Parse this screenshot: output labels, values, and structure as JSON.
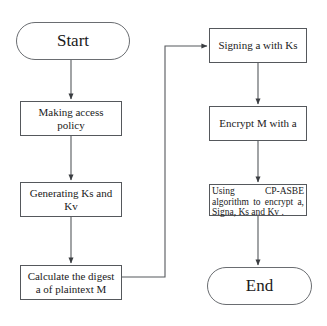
{
  "diagram": {
    "background_color": "#ffffff",
    "line_color": "#55585c",
    "text_color": "#1a1a1a",
    "nodes": {
      "start": {
        "label": "Start",
        "shape": "terminator"
      },
      "making_access_policy": {
        "label": "Making access policy",
        "shape": "process"
      },
      "generating_keys": {
        "label": "Generating Ks and Kv",
        "shape": "process"
      },
      "calculate_digest": {
        "label": "Calculate the digest a of plaintext M",
        "shape": "process"
      },
      "signing": {
        "label": "Signing a with Ks",
        "shape": "process"
      },
      "encrypt_m": {
        "label": "Encrypt M with a",
        "shape": "process"
      },
      "cp_asbe": {
        "label": "Using CP-ASBE algorithm to encrypt a, Signa, Ks and Kv .",
        "shape": "process"
      },
      "end": {
        "label": "End",
        "shape": "terminator"
      }
    },
    "edges": [
      {
        "from": "start",
        "to": "making_access_policy",
        "type": "vertical-arrow"
      },
      {
        "from": "making_access_policy",
        "to": "generating_keys",
        "type": "vertical-arrow"
      },
      {
        "from": "generating_keys",
        "to": "calculate_digest",
        "type": "vertical-arrow"
      },
      {
        "from": "calculate_digest",
        "to": "signing",
        "type": "elbow-arrow-right-up"
      },
      {
        "from": "signing",
        "to": "encrypt_m",
        "type": "vertical-arrow"
      },
      {
        "from": "encrypt_m",
        "to": "cp_asbe",
        "type": "vertical-arrow"
      },
      {
        "from": "cp_asbe",
        "to": "end",
        "type": "vertical-arrow"
      }
    ]
  }
}
